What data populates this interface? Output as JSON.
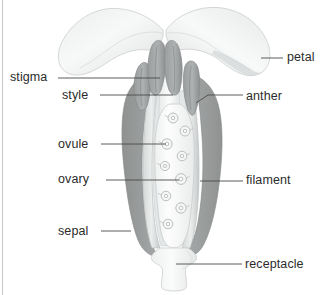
{
  "diagram": {
    "background_color": "#ffffff",
    "line_color": "#4a4a4a",
    "text_color": "#2b2b2b",
    "palette": {
      "petal_light": "#f2f3f3",
      "petal_mid": "#e2e4e4",
      "petal_shadow": "#d3d6d6",
      "sepal_dark": "#9a9c9c",
      "sepal_darker": "#8e9090",
      "anther_gray": "#9a9d9d",
      "filament_gray": "#c8cbcb",
      "ovary_white": "#fbfbfb",
      "ovule_outline": "#b6b9b9",
      "receptacle": "#f4f5f5",
      "outline": "#a9acac"
    }
  },
  "labels": [
    {
      "id": "stigma",
      "text": "stigma",
      "side": "left",
      "text_x": 10,
      "text_y": 70,
      "leader": "M58,78 L160,78"
    },
    {
      "id": "style",
      "text": "style",
      "side": "left",
      "text_x": 62,
      "text_y": 88,
      "leader": "M100,95 L173,95"
    },
    {
      "id": "ovule",
      "text": "ovule",
      "side": "left",
      "text_x": 58,
      "text_y": 137,
      "leader": "M101,144 L166,144"
    },
    {
      "id": "ovary",
      "text": "ovary",
      "side": "left",
      "text_x": 58,
      "text_y": 172,
      "leader": "M106,180 L179,180"
    },
    {
      "id": "sepal",
      "text": "sepal",
      "side": "left",
      "text_x": 58,
      "text_y": 224,
      "leader": "M101,231 L131,231"
    },
    {
      "id": "petal",
      "text": "petal",
      "side": "right",
      "text_x": 287,
      "text_y": 50,
      "leader": "M261,58 L283,58"
    },
    {
      "id": "anther",
      "text": "anther",
      "side": "right",
      "text_x": 246,
      "text_y": 89,
      "leader": "M196,103 L208,95 L243,95"
    },
    {
      "id": "filament",
      "text": "filament",
      "side": "right",
      "text_x": 246,
      "text_y": 173,
      "leader": "M200,181 L243,181"
    },
    {
      "id": "receptacle",
      "text": "receptacle",
      "side": "right",
      "text_x": 245,
      "text_y": 257,
      "leader": "M176,264 L242,264"
    }
  ],
  "parts": {
    "petal_left": "petal-left",
    "petal_right": "petal-right",
    "sepal_left": "sepal-left",
    "sepal_right": "sepal-right",
    "anther_left_outer": "anther-left-outer",
    "anther_left_inner": "anther-left-inner",
    "anther_right_inner": "anther-right-inner",
    "anther_right_outer": "anther-right-outer",
    "filament_left": "filament-left",
    "filament_right": "filament-right",
    "style_stalk": "style",
    "stigma_tip": "stigma",
    "ovary_body": "ovary",
    "receptacle_base": "receptacle"
  },
  "ovules": [
    {
      "cx": 173,
      "cy": 118,
      "r": 5.0
    },
    {
      "cx": 185,
      "cy": 131,
      "r": 5.0
    },
    {
      "cx": 167,
      "cy": 144,
      "r": 5.2
    },
    {
      "cx": 182,
      "cy": 156,
      "r": 4.8
    },
    {
      "cx": 165,
      "cy": 166,
      "r": 4.6
    },
    {
      "cx": 181,
      "cy": 179,
      "r": 5.4
    },
    {
      "cx": 166,
      "cy": 196,
      "r": 4.8
    },
    {
      "cx": 181,
      "cy": 208,
      "r": 5.2
    },
    {
      "cx": 168,
      "cy": 224,
      "r": 4.8
    }
  ]
}
